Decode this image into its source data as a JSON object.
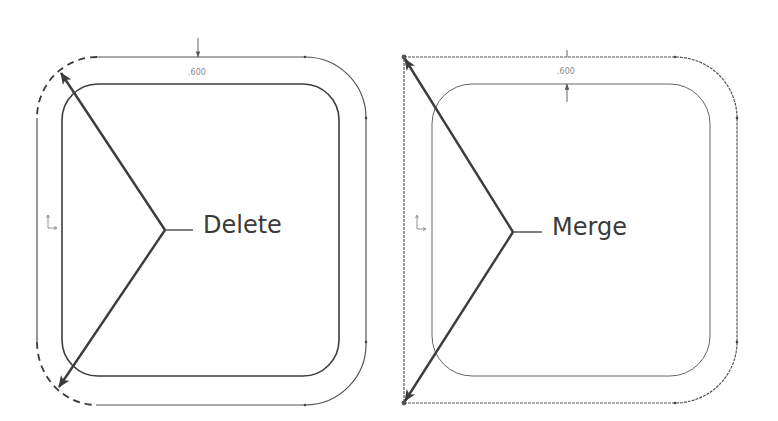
{
  "figures": [
    {
      "id": "delete",
      "label": "Delete",
      "dimension": ".600",
      "corner_style": "rounded (removed corners shown dashed)"
    },
    {
      "id": "merge",
      "label": "Merge",
      "dimension": ".600",
      "corner_style": "sharp (merged corners)"
    }
  ],
  "colors": {
    "line": "#3c3c3c",
    "thin_line": "#555555",
    "dim_text": "#8a8a8a",
    "label_text": "#3a3a3a",
    "background": "#ffffff"
  },
  "icons": {
    "origin": "origin-axes-icon",
    "arrowhead": "arrowhead-icon",
    "dimension_arrow": "dimension-arrow-icon"
  }
}
